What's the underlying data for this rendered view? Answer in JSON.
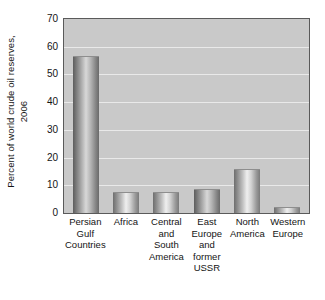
{
  "chart_data": {
    "type": "bar",
    "title": "",
    "xlabel": "",
    "ylabel": "Percent of world crude oil reserves, 2006",
    "ylabel_lines": [
      "Percent of world crude oil reserves,",
      "2006"
    ],
    "categories": [
      "Persian Gulf Countries",
      "Africa",
      "Central and South America",
      "East Europe and former USSR",
      "North America",
      "Western Europe"
    ],
    "category_lines": [
      [
        "Persian",
        "Gulf",
        "Countries"
      ],
      [
        "Africa"
      ],
      [
        "Central",
        "and",
        "South",
        "America"
      ],
      [
        "East",
        "Europe",
        "and",
        "former",
        "USSR"
      ],
      [
        "North",
        "America"
      ],
      [
        "Western",
        "Europe"
      ]
    ],
    "values": [
      56.5,
      7.5,
      7.7,
      8.8,
      15.8,
      2.0
    ],
    "ylim": [
      0,
      70
    ],
    "yticks": [
      0,
      10,
      20,
      30,
      40,
      50,
      60,
      70
    ],
    "ytick_labels": [
      "0",
      "10",
      "20",
      "30",
      "40",
      "50",
      "60",
      "70"
    ],
    "grid": true,
    "grid_axis": "y",
    "legend": false,
    "plot_background": "#c9c9c9",
    "gridline_color": "#eeeeee",
    "bar_color_light": "#efefef",
    "bar_color_dark": "#5d5d5d",
    "axis_color": "#5a5a5a"
  },
  "caption_remnant": ""
}
